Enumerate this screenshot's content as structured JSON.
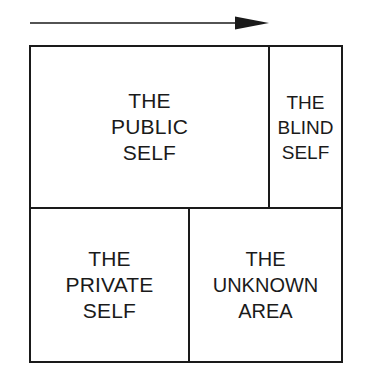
{
  "diagram": {
    "name": "johari-window",
    "type": "quadrant-matrix",
    "background_color": "#ffffff",
    "line_color": "#1a1a1a"
  },
  "arrow": {
    "icon": "arrow-right-icon",
    "direction": "right",
    "label": ""
  },
  "quadrants": [
    {
      "id": "public-self",
      "label": "THE\nPUBLIC\nSELF",
      "row": "top",
      "column": "left"
    },
    {
      "id": "blind-self",
      "label": "THE\nBLIND\nSELF",
      "row": "top",
      "column": "right"
    },
    {
      "id": "private-self",
      "label": "THE\nPRIVATE\nSELF",
      "row": "bottom",
      "column": "left"
    },
    {
      "id": "unknown-area",
      "label": "THE\nUNKNOWN\nAREA",
      "row": "bottom",
      "column": "right"
    }
  ]
}
